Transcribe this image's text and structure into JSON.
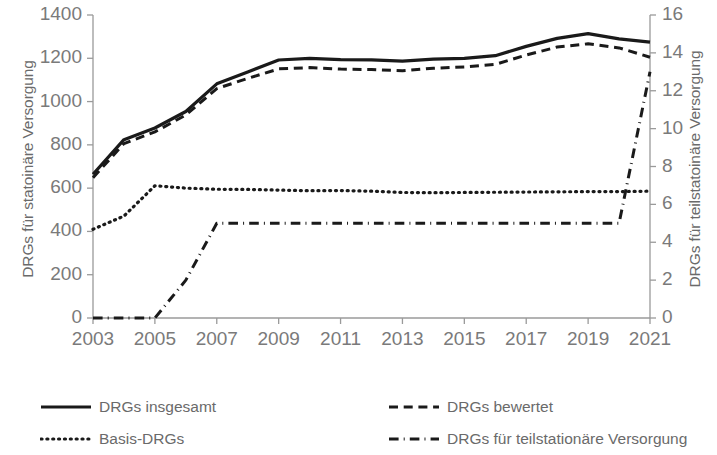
{
  "chart_data": {
    "type": "line",
    "title": "",
    "xlabel": "",
    "x": [
      2003,
      2004,
      2005,
      2006,
      2007,
      2008,
      2009,
      2010,
      2011,
      2012,
      2013,
      2014,
      2015,
      2016,
      2017,
      2018,
      2019,
      2020,
      2021
    ],
    "xticks": [
      "2003",
      "2005",
      "2007",
      "2009",
      "2011",
      "2013",
      "2015",
      "2017",
      "2019",
      "2021"
    ],
    "xlim": [
      2003,
      2021
    ],
    "grid": false,
    "legend_position": "bottom",
    "axes": [
      {
        "id": "left",
        "label": "DRGs für statoinäre Versorgung",
        "ylim": [
          0,
          1400
        ],
        "ytick_step": 200,
        "yticks": [
          "0",
          "200",
          "400",
          "600",
          "800",
          "1000",
          "1200",
          "1400"
        ]
      },
      {
        "id": "right",
        "label": "DRGs für teilstatoinäre Versorgung",
        "ylim": [
          0,
          16
        ],
        "ytick_step": 2,
        "yticks": [
          "0",
          "2",
          "4",
          "6",
          "8",
          "10",
          "12",
          "14",
          "16"
        ]
      }
    ],
    "series": [
      {
        "name": "DRGs insgesamt",
        "axis": "left",
        "style": "solid",
        "color": "#1a1a1a",
        "width": 3.2,
        "values": [
          664,
          824,
          878,
          954,
          1082,
          1137,
          1192,
          1200,
          1194,
          1193,
          1187,
          1196,
          1200,
          1212,
          1255,
          1292,
          1314,
          1290,
          1275
        ]
      },
      {
        "name": "DRGs bewertet",
        "axis": "left",
        "style": "dashed",
        "color": "#1a1a1a",
        "width": 3.0,
        "values": [
          648,
          806,
          860,
          938,
          1060,
          1107,
          1151,
          1157,
          1150,
          1148,
          1142,
          1154,
          1160,
          1172,
          1215,
          1252,
          1267,
          1248,
          1205
        ]
      },
      {
        "name": "Basis-DRGs",
        "axis": "left",
        "style": "dotted",
        "color": "#1a1a1a",
        "width": 3.2,
        "values": [
          410,
          471,
          611,
          600,
          595,
          594,
          591,
          588,
          589,
          586,
          580,
          579,
          580,
          581,
          582,
          583,
          584,
          584,
          586
        ]
      },
      {
        "name": "DRGs für teilstationäre Versorgung",
        "axis": "right",
        "style": "dashdot",
        "color": "#1a1a1a",
        "width": 3.0,
        "values": [
          0,
          0,
          0,
          2,
          5,
          5,
          5,
          5,
          5,
          5,
          5,
          5,
          5,
          5,
          5,
          5,
          5,
          5,
          13
        ]
      }
    ]
  },
  "legend": {
    "items": [
      {
        "label": "DRGs insgesamt",
        "style": "solid"
      },
      {
        "label": "Basis-DRGs",
        "style": "dotted"
      },
      {
        "label": "DRGs bewertet",
        "style": "dashed"
      },
      {
        "label": "DRGs für teilstationäre Versorgung",
        "style": "dashdot"
      }
    ]
  }
}
